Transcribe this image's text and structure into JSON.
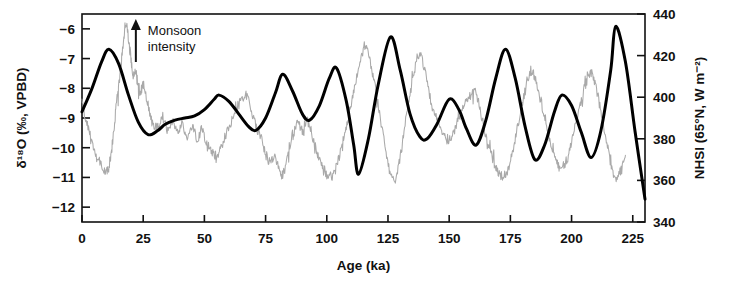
{
  "chart_data": {
    "type": "line",
    "title": "",
    "xlabel": "Age (ka)",
    "ylabel_left": "δ¹⁸O (‰, VPBD)",
    "ylabel_right": "NHSI (65°N, W m⁻²)",
    "xlim": [
      0,
      230
    ],
    "ylim_left": [
      -5.5,
      -12.5
    ],
    "ylim_right": [
      340,
      440
    ],
    "left_axis_inverted": true,
    "grid": false,
    "legend": false,
    "xticks": [
      0,
      25,
      50,
      75,
      100,
      125,
      150,
      175,
      200,
      225
    ],
    "xticklabels": [
      "0",
      "25",
      "50",
      "75",
      "100",
      "125",
      "150",
      "175",
      "200",
      "225"
    ],
    "yticks_left": [
      -12,
      -11,
      -10,
      -9,
      -8,
      -7,
      -6
    ],
    "yticklabels_left": [
      "−12",
      "−11",
      "−10",
      "−9",
      "−8",
      "−7",
      "−6"
    ],
    "yticks_right": [
      340,
      360,
      380,
      400,
      420,
      440
    ],
    "yticklabels_right": [
      "340",
      "360",
      "380",
      "400",
      "420",
      "440"
    ],
    "annotations": [
      {
        "name": "monsoon-intensity",
        "line1": "Monsoon",
        "line2": "intensity",
        "arrow": "up",
        "x_ka": 22,
        "colors": "#111111"
      }
    ],
    "colors": {
      "proxy": "#a9a9a9",
      "insolation": "#000000",
      "axis": "#111111",
      "background": "#ffffff"
    },
    "series": [
      {
        "name": "Speleothem δ¹⁸O record",
        "color": "#a9a9a9",
        "axis": "left",
        "style": "noisy-line",
        "x": [
          0,
          2,
          4,
          6,
          8,
          10,
          11,
          12,
          13,
          14,
          15,
          16,
          17,
          18,
          19,
          20,
          21,
          22,
          23,
          24,
          25,
          27,
          29,
          31,
          33,
          35,
          37,
          39,
          41,
          43,
          45,
          47,
          49,
          51,
          53,
          55,
          57,
          59,
          61,
          63,
          65,
          67,
          69,
          71,
          73,
          75,
          77,
          79,
          81,
          82,
          84,
          86,
          88,
          90,
          92,
          94,
          96,
          98,
          100,
          102,
          104,
          106,
          108,
          110,
          112,
          114,
          116,
          118,
          120,
          122,
          124,
          126,
          128,
          130,
          132,
          134,
          136,
          138,
          140,
          142,
          144,
          146,
          148,
          150,
          152,
          154,
          156,
          158,
          160,
          162,
          164,
          166,
          168,
          170,
          172,
          174,
          176,
          178,
          180,
          182,
          184,
          186,
          188,
          190,
          192,
          194,
          196,
          198,
          200,
          202,
          204,
          206,
          208,
          210,
          212,
          214,
          216,
          218,
          220,
          222
        ],
        "y": [
          -8.5,
          -9.2,
          -9.8,
          -10.3,
          -10.6,
          -10.8,
          -10.6,
          -10.1,
          -9.4,
          -8.6,
          -7.9,
          -7.2,
          -6.4,
          -5.8,
          -6.3,
          -7.0,
          -7.6,
          -7.4,
          -7.9,
          -8.1,
          -7.9,
          -8.6,
          -9.2,
          -9.3,
          -9.0,
          -9.4,
          -9.1,
          -9.5,
          -9.2,
          -9.6,
          -9.3,
          -9.7,
          -9.4,
          -9.9,
          -10.1,
          -10.3,
          -10.0,
          -9.6,
          -9.1,
          -8.7,
          -8.4,
          -8.2,
          -8.7,
          -9.2,
          -9.7,
          -10.2,
          -10.5,
          -10.4,
          -10.8,
          -10.9,
          -10.2,
          -9.6,
          -9.1,
          -9.4,
          -9.0,
          -9.6,
          -10.2,
          -10.6,
          -10.9,
          -11.0,
          -10.6,
          -10.0,
          -9.3,
          -8.5,
          -7.7,
          -7.0,
          -6.6,
          -7.2,
          -8.0,
          -9.0,
          -10.0,
          -10.8,
          -11.1,
          -10.3,
          -9.2,
          -8.1,
          -7.3,
          -6.8,
          -7.4,
          -8.2,
          -8.8,
          -9.3,
          -9.6,
          -9.8,
          -9.4,
          -9.0,
          -8.6,
          -8.3,
          -8.0,
          -8.5,
          -9.2,
          -9.9,
          -10.4,
          -10.8,
          -11.0,
          -10.7,
          -10.1,
          -9.3,
          -8.5,
          -7.8,
          -7.4,
          -7.9,
          -8.6,
          -9.3,
          -10.0,
          -10.5,
          -10.7,
          -10.4,
          -9.8,
          -9.1,
          -8.4,
          -7.8,
          -7.5,
          -8.0,
          -8.8,
          -9.7,
          -10.5,
          -11.0,
          -10.8,
          -10.3
        ]
      },
      {
        "name": "Northern Hemisphere summer insolation (65°N)",
        "color": "#000000",
        "axis": "right",
        "style": "smooth-line",
        "x": [
          0,
          4,
          8,
          11,
          15,
          19,
          23,
          27,
          31,
          34,
          38,
          42,
          46,
          50,
          54,
          56,
          60,
          64,
          68,
          71,
          75,
          79,
          82,
          86,
          90,
          93,
          97,
          101,
          104,
          108,
          111,
          113,
          117,
          121,
          126,
          130,
          134,
          138,
          141,
          145,
          150,
          154,
          157,
          161,
          165,
          169,
          173,
          177,
          181,
          185,
          189,
          193,
          196,
          200,
          204,
          208,
          212,
          216,
          218,
          222,
          226,
          230
        ],
        "y": [
          393,
          404,
          417,
          423,
          416,
          401,
          388,
          382,
          384,
          387,
          389,
          390,
          391,
          394,
          399,
          401,
          398,
          392,
          386,
          384,
          390,
          402,
          411,
          403,
          392,
          389,
          396,
          409,
          414,
          398,
          377,
          363,
          380,
          406,
          429,
          413,
          392,
          381,
          380,
          387,
          399,
          394,
          385,
          377,
          389,
          409,
          423,
          409,
          386,
          370,
          377,
          393,
          401,
          396,
          383,
          371,
          384,
          413,
          434,
          417,
          383,
          351
        ]
      }
    ]
  }
}
